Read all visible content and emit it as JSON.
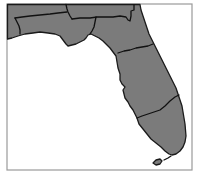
{
  "map": {
    "subject": "Florida",
    "regions_count": 6,
    "colors": {
      "land": "#7b7b7b",
      "border": "#111111",
      "water": "#ffffff",
      "frame": "#9a9a9a"
    }
  }
}
